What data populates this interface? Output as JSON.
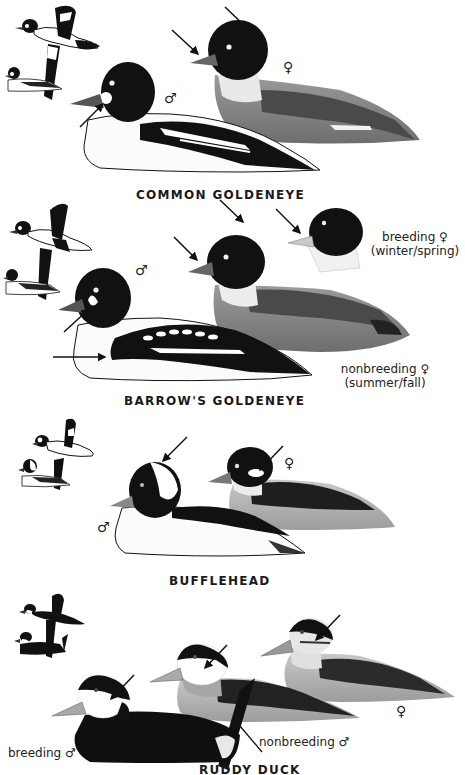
{
  "plate": {
    "species": [
      {
        "name": "COMMON GOLDENEYE",
        "labels": {
          "male": "♂",
          "female": "♀"
        }
      },
      {
        "name": "BARROW'S GOLDENEYE",
        "labels": {
          "male": "♂",
          "breeding_female_line1": "breeding ♀",
          "breeding_female_line2": "(winter/spring)",
          "nonbreeding_female_line1": "nonbreeding ♀",
          "nonbreeding_female_line2": "(summer/fall)"
        }
      },
      {
        "name": "BUFFLEHEAD",
        "labels": {
          "male": "♂",
          "female": "♀"
        }
      },
      {
        "name": "RUDDY DUCK",
        "labels": {
          "breeding_male": "breeding ♂",
          "nonbreeding_male": "nonbreeding ♂",
          "female": "♀"
        }
      }
    ]
  }
}
